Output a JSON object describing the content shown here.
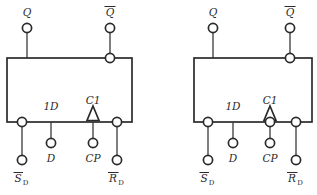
{
  "figure": {
    "type": "logic-symbol-schematic",
    "background_color": "#ffffff",
    "line_color": "#2b2b2b",
    "wire_color": "#3a3a3a"
  },
  "symbols": [
    {
      "id": "left-flipflop",
      "name": "positive-edge-triggered-d-flip-flop",
      "box": {
        "x": 7,
        "y": 58,
        "width": 125,
        "height": 64
      },
      "outputs": [
        {
          "name": "Q",
          "label": "Q",
          "overbar": false,
          "terminal": {
            "cx": 27,
            "cy": 28,
            "r": 4.6
          },
          "inverting_bubble": false,
          "label_pos": {
            "x": 27,
            "y": 16
          }
        },
        {
          "name": "Q-not",
          "label": "Q",
          "overbar": true,
          "terminal": {
            "cx": 110,
            "cy": 28,
            "r": 4.6
          },
          "inverting_bubble": true,
          "bubble": {
            "cx": 110,
            "cy": 58,
            "r": 4.6
          },
          "label_pos": {
            "x": 110,
            "y": 16
          }
        }
      ],
      "inputs": [
        {
          "name": "S-D-not",
          "label": "S",
          "overbar": true,
          "subscript": "D",
          "inner_label": "",
          "inverting_bubble": true,
          "bubble": {
            "cx": 22,
            "cy": 122,
            "r": 4.6
          },
          "terminal": {
            "cx": 22,
            "cy": 160,
            "r": 4.6
          },
          "label_pos": {
            "x": 22,
            "y": 182
          }
        },
        {
          "name": "D",
          "label": "D",
          "overbar": false,
          "subscript": "",
          "inner_label": "1D",
          "inner_label_pos": {
            "x": 51,
            "y": 110
          },
          "inverting_bubble": false,
          "terminal": {
            "cx": 51,
            "cy": 143,
            "r": 4.6
          },
          "label_pos": {
            "x": 51,
            "y": 162
          }
        },
        {
          "name": "CP",
          "label": "CP",
          "overbar": false,
          "subscript": "",
          "inner_label": "C1",
          "inner_label_pos": {
            "x": 93,
            "y": 104
          },
          "dynamic_triangle": true,
          "inverting_bubble": false,
          "terminal": {
            "cx": 93,
            "cy": 143,
            "r": 4.6
          },
          "label_pos": {
            "x": 93,
            "y": 162
          }
        },
        {
          "name": "R-D-not",
          "label": "R",
          "overbar": true,
          "subscript": "D",
          "inner_label": "",
          "inverting_bubble": true,
          "bubble": {
            "cx": 117,
            "cy": 122,
            "r": 4.6
          },
          "terminal": {
            "cx": 117,
            "cy": 160,
            "r": 4.6
          },
          "label_pos": {
            "x": 117,
            "y": 182
          }
        }
      ]
    },
    {
      "id": "right-flipflop",
      "name": "negative-edge-triggered-d-flip-flop",
      "box": {
        "x": 194,
        "y": 58,
        "width": 118,
        "height": 64
      },
      "outputs": [
        {
          "name": "Q",
          "label": "Q",
          "overbar": false,
          "terminal": {
            "cx": 213,
            "cy": 28,
            "r": 4.6
          },
          "inverting_bubble": false,
          "label_pos": {
            "x": 213,
            "y": 16
          }
        },
        {
          "name": "Q-not",
          "label": "Q",
          "overbar": true,
          "terminal": {
            "cx": 290,
            "cy": 28,
            "r": 4.6
          },
          "inverting_bubble": true,
          "bubble": {
            "cx": 290,
            "cy": 58,
            "r": 4.6
          },
          "label_pos": {
            "x": 290,
            "y": 16
          }
        }
      ],
      "inputs": [
        {
          "name": "S-D-not",
          "label": "S",
          "overbar": true,
          "subscript": "D",
          "inner_label": "",
          "inverting_bubble": true,
          "bubble": {
            "cx": 208,
            "cy": 122,
            "r": 4.6
          },
          "terminal": {
            "cx": 208,
            "cy": 160,
            "r": 4.6
          },
          "label_pos": {
            "x": 208,
            "y": 182
          }
        },
        {
          "name": "D",
          "label": "D",
          "overbar": false,
          "subscript": "",
          "inner_label": "1D",
          "inner_label_pos": {
            "x": 233,
            "y": 110
          },
          "inverting_bubble": false,
          "terminal": {
            "cx": 233,
            "cy": 143,
            "r": 4.6
          },
          "label_pos": {
            "x": 233,
            "y": 162
          }
        },
        {
          "name": "CP",
          "label": "CP",
          "overbar": false,
          "subscript": "",
          "inner_label": "C1",
          "inner_label_pos": {
            "x": 270,
            "y": 104
          },
          "dynamic_triangle": true,
          "inverting_bubble": true,
          "bubble": {
            "cx": 270,
            "cy": 122,
            "r": 4.6
          },
          "terminal": {
            "cx": 270,
            "cy": 143,
            "r": 4.6
          },
          "label_pos": {
            "x": 270,
            "y": 162
          }
        },
        {
          "name": "R-D-not",
          "label": "R",
          "overbar": true,
          "subscript": "D",
          "inner_label": "",
          "inverting_bubble": true,
          "bubble": {
            "cx": 296,
            "cy": 122,
            "r": 4.6
          },
          "terminal": {
            "cx": 296,
            "cy": 160,
            "r": 4.6
          },
          "label_pos": {
            "x": 296,
            "y": 182
          }
        }
      ]
    }
  ],
  "text": {
    "q": "Q",
    "q_bar": "Q",
    "d_inner": "1D",
    "c_inner": "C1",
    "d": "D",
    "cp": "CP",
    "s": "S",
    "r": "R",
    "sub_d": "D"
  }
}
